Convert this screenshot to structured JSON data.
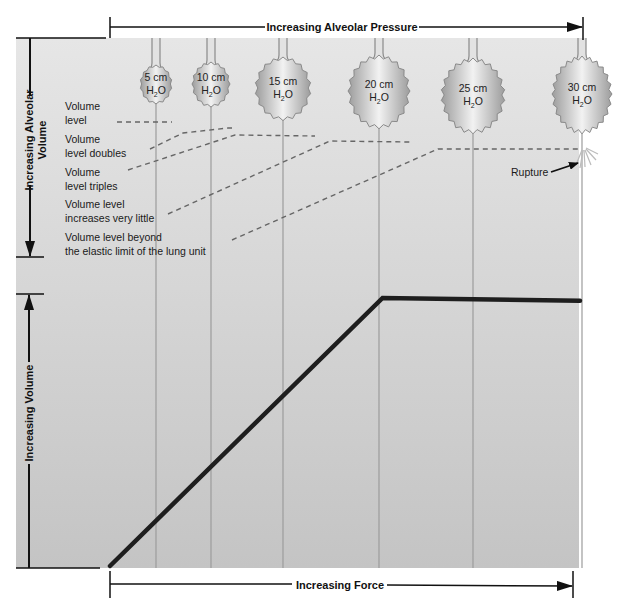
{
  "diagram": {
    "top_axis_label": "Increasing Alveolar Pressure",
    "bottom_axis_label": "Increasing Force",
    "left_upper_axis_label_line1": "Increasing Alveolar",
    "left_upper_axis_label_line2": "Volume",
    "left_lower_axis_label": "Increasing Volume",
    "rupture_label": "Rupture",
    "alveoli": [
      {
        "pressure": "5 cm",
        "unit": "H2O",
        "unit_main": "H",
        "unit_sub": "2",
        "unit_tail": "O",
        "relative_volume": 1
      },
      {
        "pressure": "10 cm",
        "unit": "H2O",
        "unit_main": "H",
        "unit_sub": "2",
        "unit_tail": "O",
        "relative_volume": 2
      },
      {
        "pressure": "15 cm",
        "unit": "H2O",
        "unit_main": "H",
        "unit_sub": "2",
        "unit_tail": "O",
        "relative_volume": 3
      },
      {
        "pressure": "20 cm",
        "unit": "H2O",
        "unit_main": "H",
        "unit_sub": "2",
        "unit_tail": "O",
        "relative_volume": 3.2
      },
      {
        "pressure": "25 cm",
        "unit": "H2O",
        "unit_main": "H",
        "unit_sub": "2",
        "unit_tail": "O",
        "relative_volume": 3.3
      },
      {
        "pressure": "30 cm",
        "unit": "H2O",
        "unit_main": "H",
        "unit_sub": "2",
        "unit_tail": "O",
        "relative_volume": 3.3,
        "ruptured": true
      }
    ],
    "annotations": [
      {
        "line1": "Volume",
        "line2": "level"
      },
      {
        "line1": "Volume",
        "line2": "level doubles"
      },
      {
        "line1": "Volume",
        "line2": "level triples"
      },
      {
        "line1": "Volume level",
        "line2": "increases very little"
      },
      {
        "line1": "Volume level beyond",
        "line2": "the elastic limit of the lung unit"
      }
    ],
    "curve": {
      "description": "Volume rises linearly with force, then plateaus at the elastic limit",
      "points": [
        {
          "force": 0,
          "volume": 0
        },
        {
          "force": 0.58,
          "volume": 1.0
        },
        {
          "force": 1.0,
          "volume": 0.99
        }
      ]
    },
    "colors": {
      "panel": "#d6d6d6",
      "balloon_light": "#eeeeee",
      "balloon_dark": "#9a9a9a",
      "curve": "#1e1e1e",
      "dashed": "#666666"
    }
  }
}
